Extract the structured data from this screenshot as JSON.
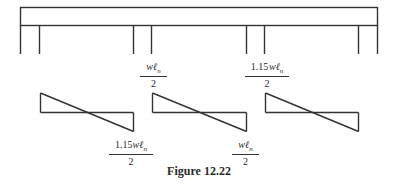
{
  "figure": {
    "caption": "Figure 12.22",
    "colors": {
      "line": "#333333",
      "text": "#2a2a2a",
      "background": "#ffffff"
    }
  },
  "beam": {
    "description": "Continuous beam on four column supports (frame)",
    "support_count": 4
  },
  "shear_diagrams": [
    {
      "span": 1,
      "top_label": "",
      "bottom_label": {
        "coef": "1.15",
        "var": "wℓ",
        "sub": "n",
        "den": "2"
      }
    },
    {
      "span": 2,
      "top_label": {
        "coef": "",
        "var": "wℓ",
        "sub": "n",
        "den": "2"
      },
      "bottom_label": {
        "coef": "",
        "var": "wℓ",
        "sub": "n",
        "den": "2"
      }
    },
    {
      "span": 3,
      "top_label": {
        "coef": "1.15",
        "var": "wℓ",
        "sub": "n",
        "den": "2"
      },
      "bottom_label": ""
    }
  ],
  "labels": {
    "span1_bottom": {
      "coef": "1.15",
      "var": "wℓ",
      "sub": "n",
      "den": "2"
    },
    "span2_top": {
      "coef": "",
      "var": "wℓ",
      "sub": "n",
      "den": "2"
    },
    "span2_bottom": {
      "coef": "",
      "var": "wℓ",
      "sub": "n",
      "den": "2"
    },
    "span3_top": {
      "coef": "1.15",
      "var": "wℓ",
      "sub": "n",
      "den": "2"
    }
  }
}
